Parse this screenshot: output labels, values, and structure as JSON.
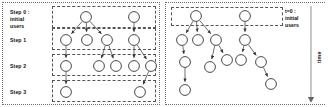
{
  "figure": {
    "title": "",
    "panels": [
      {
        "id": "left",
        "kind": "discrete-step-cascade",
        "labels": [
          {
            "name": "step-0",
            "text": "Step 0 :\ninitial\nusers"
          },
          {
            "name": "step-1",
            "text": "Step 1"
          },
          {
            "name": "step-2",
            "text": "Step 2"
          },
          {
            "name": "step-3",
            "text": "Step 3"
          }
        ],
        "bands": [
          {
            "name": "band-step-0",
            "x": 52,
            "y": 6,
            "w": 104,
            "h": 22
          },
          {
            "name": "band-step-1",
            "x": 52,
            "y": 28,
            "w": 104,
            "h": 22
          },
          {
            "name": "band-step-2",
            "x": 52,
            "y": 54,
            "w": 104,
            "h": 22
          },
          {
            "name": "band-step-3",
            "x": 52,
            "y": 80,
            "w": 104,
            "h": 22
          }
        ],
        "nodes": [
          {
            "id": "a0",
            "x": 86,
            "y": 17,
            "r": 5.4,
            "step": 0
          },
          {
            "id": "b0",
            "x": 134,
            "y": 17,
            "r": 5.4,
            "step": 0
          },
          {
            "id": "a1",
            "x": 66,
            "y": 40,
            "r": 5.4,
            "step": 1
          },
          {
            "id": "a2",
            "x": 87,
            "y": 40,
            "r": 5.4,
            "step": 1
          },
          {
            "id": "a3",
            "x": 107,
            "y": 40,
            "r": 5.4,
            "step": 1
          },
          {
            "id": "b1",
            "x": 134,
            "y": 40,
            "r": 5.4,
            "step": 1
          },
          {
            "id": "c1",
            "x": 66,
            "y": 66,
            "r": 5.4,
            "step": 2
          },
          {
            "id": "c2",
            "x": 99,
            "y": 66,
            "r": 5.4,
            "step": 2
          },
          {
            "id": "c3",
            "x": 116,
            "y": 66,
            "r": 5.4,
            "step": 2
          },
          {
            "id": "c4",
            "x": 134,
            "y": 66,
            "r": 5.4,
            "step": 2
          },
          {
            "id": "c5",
            "x": 151,
            "y": 66,
            "r": 5.4,
            "step": 2
          },
          {
            "id": "d1",
            "x": 66,
            "y": 92,
            "r": 5.4,
            "step": 3
          },
          {
            "id": "d2",
            "x": 140,
            "y": 92,
            "r": 5.4,
            "step": 3
          }
        ],
        "edges": [
          {
            "from": "a0",
            "to": "a1"
          },
          {
            "from": "a0",
            "to": "a2"
          },
          {
            "from": "a0",
            "to": "a3"
          },
          {
            "from": "b0",
            "to": "b1"
          },
          {
            "from": "a1",
            "to": "c1"
          },
          {
            "from": "a3",
            "to": "c2"
          },
          {
            "from": "a3",
            "to": "c3"
          },
          {
            "from": "b1",
            "to": "c4"
          },
          {
            "from": "b1",
            "to": "c5"
          },
          {
            "from": "c1",
            "to": "d1"
          },
          {
            "from": "c5",
            "to": "d2"
          }
        ]
      },
      {
        "id": "right",
        "kind": "continuous-time-cascade",
        "labels": [
          {
            "name": "t0",
            "text": "t=0 :\ninitial\nusers"
          },
          {
            "name": "time-axis",
            "text": "time"
          }
        ],
        "bands": [
          {
            "name": "band-t0",
            "x": 8,
            "y": 7,
            "w": 112,
            "h": 19
          }
        ],
        "nodes": [
          {
            "id": "r0",
            "x": 33,
            "y": 16,
            "r": 5.4
          },
          {
            "id": "s0",
            "x": 82,
            "y": 16,
            "r": 5.4
          },
          {
            "id": "r1",
            "x": 19,
            "y": 40,
            "r": 5.4
          },
          {
            "id": "r2",
            "x": 35,
            "y": 40,
            "r": 5.4
          },
          {
            "id": "r3",
            "x": 53,
            "y": 40,
            "r": 5.4
          },
          {
            "id": "s1",
            "x": 82,
            "y": 40,
            "r": 5.4
          },
          {
            "id": "r4",
            "x": 22,
            "y": 62,
            "r": 5.4
          },
          {
            "id": "r5",
            "x": 47,
            "y": 67,
            "r": 5.4
          },
          {
            "id": "r6",
            "x": 64,
            "y": 60,
            "r": 5.4
          },
          {
            "id": "s2",
            "x": 78,
            "y": 60,
            "r": 5.4
          },
          {
            "id": "s3",
            "x": 98,
            "y": 62,
            "r": 5.4
          },
          {
            "id": "r7",
            "x": 22,
            "y": 90,
            "r": 5.4
          },
          {
            "id": "s4",
            "x": 108,
            "y": 84,
            "r": 5.4
          }
        ],
        "edges": [
          {
            "from": "r0",
            "to": "r1"
          },
          {
            "from": "r0",
            "to": "r2"
          },
          {
            "from": "r0",
            "to": "r3"
          },
          {
            "from": "s0",
            "to": "s1"
          },
          {
            "from": "r1",
            "to": "r4"
          },
          {
            "from": "r3",
            "to": "r5"
          },
          {
            "from": "r3",
            "to": "r6"
          },
          {
            "from": "s1",
            "to": "s2"
          },
          {
            "from": "s1",
            "to": "s3"
          },
          {
            "from": "r4",
            "to": "r7"
          },
          {
            "from": "s3",
            "to": "s4"
          }
        ],
        "time_axis": {
          "x": 148,
          "y1": 6,
          "y2": 100
        }
      }
    ],
    "colors": {
      "node_stroke": "#4a4a4a",
      "node_fill": "#ffffff",
      "edge": "#4a4a4a",
      "band_border": "#555555",
      "frame_border": "#6f6f6f",
      "text": "#111111",
      "axis": "#9a9a9a"
    }
  }
}
